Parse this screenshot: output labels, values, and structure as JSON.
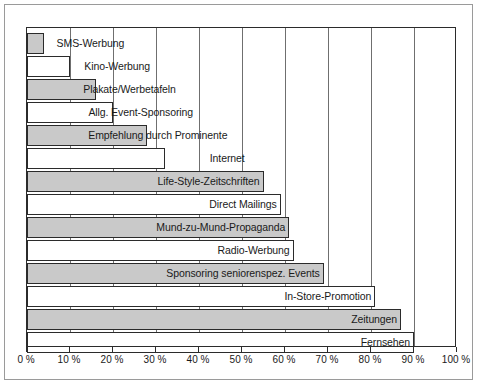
{
  "chart_data": {
    "type": "bar",
    "orientation": "horizontal",
    "title": "",
    "xlabel": "",
    "ylabel": "",
    "xlim": [
      0,
      100
    ],
    "grid": true,
    "legend": "none",
    "tick_labels": [
      "0 %",
      "10 %",
      "20 %",
      "30 %",
      "40 %",
      "50 %",
      "60 %",
      "70 %",
      "80 %",
      "90 %",
      "100 %"
    ],
    "tick_values": [
      0,
      10,
      20,
      30,
      40,
      50,
      60,
      70,
      80,
      90,
      100
    ],
    "categories": [
      "SMS-Werbung",
      "Kino-Werbung",
      "Plakate/Werbetafeln",
      "Allg. Event-Sponsoring",
      "Empfehlung durch Prominente",
      "Internet",
      "Life-Style-Zeitschriften",
      "Direct Mailings",
      "Mund-zu-Mund-Propaganda",
      "Radio-Werbung",
      "Sponsoring seniorenspez. Events",
      "In-Store-Promotion",
      "Zeitungen",
      "Fernsehen"
    ],
    "values": [
      4,
      10,
      16,
      20,
      28,
      32,
      55,
      59,
      61,
      62,
      69,
      81,
      87,
      90
    ],
    "bar_fills": [
      "gray",
      "white",
      "gray",
      "white",
      "gray",
      "white",
      "gray",
      "white",
      "gray",
      "white",
      "gray",
      "white",
      "gray",
      "white"
    ],
    "colors": {
      "bar_gray": "#c9c9c9",
      "bar_white": "#ffffff",
      "bar_border": "#2b2b2b",
      "gridline": "#6f6f6f",
      "axis": "#2b2b2b",
      "frame": "#9a9a9a",
      "background": "#ffffff",
      "text": "#1a1a1a"
    }
  },
  "caption": {
    "text": ""
  }
}
